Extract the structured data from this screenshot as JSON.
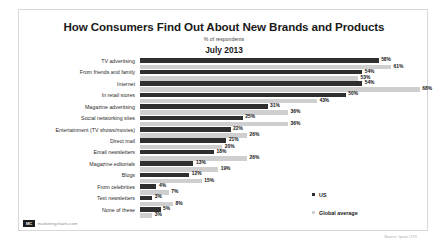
{
  "card": {
    "title": "How Consumers Find Out About New Brands and Products",
    "subtitle": "% of respondents",
    "period": "July 2013"
  },
  "legend": {
    "us_label": "US",
    "us_color": "#2f2f2f",
    "global_label": "Global average",
    "global_color": "#cfcfcf"
  },
  "footer": {
    "logo_badge": "MC",
    "logo_text": "marketingcharts.com",
    "source": "Source: Ipsos OTX"
  },
  "chart_data": {
    "type": "bar",
    "orientation": "horizontal",
    "title": "How Consumers Find Out About New Brands and Products",
    "subtitle": "% of respondents",
    "period": "July 2013",
    "xlabel": "",
    "ylabel": "",
    "xlim": [
      0,
      70
    ],
    "grid": false,
    "legend_position": "right",
    "value_suffix": "%",
    "categories": [
      "TV advertising",
      "From friends and family",
      "Internet",
      "In retail stores",
      "Magazine advertising",
      "Social networking sites",
      "Entertainment (TV shows/movies)",
      "Direct mail",
      "Email newsletters",
      "Magazine editorials",
      "Blogs",
      "From celebrities",
      "Text newsletters",
      "None of these"
    ],
    "series": [
      {
        "name": "US",
        "color": "#2f2f2f",
        "values": [
          58,
          54,
          54,
          50,
          31,
          25,
          22,
          21,
          18,
          13,
          12,
          4,
          3,
          5
        ]
      },
      {
        "name": "Global average",
        "color": "#cfcfcf",
        "values": [
          61,
          53,
          68,
          43,
          36,
          36,
          26,
          20,
          26,
          19,
          15,
          7,
          8,
          3
        ]
      }
    ]
  }
}
